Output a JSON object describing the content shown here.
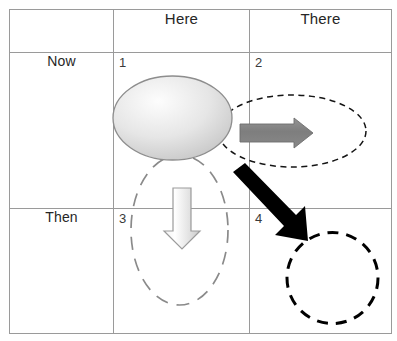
{
  "diagram": {
    "columns": [
      {
        "key": "rowlabel",
        "label": ""
      },
      {
        "key": "here",
        "label": "Here"
      },
      {
        "key": "there",
        "label": "There"
      }
    ],
    "rows": [
      {
        "key": "now",
        "label": "Now"
      },
      {
        "key": "then",
        "label": "Then"
      }
    ],
    "quadrants": [
      {
        "number": "1",
        "row": "Now",
        "column": "Here",
        "shape": "solid-gray-gradient-ellipse"
      },
      {
        "number": "2",
        "row": "Now",
        "column": "There",
        "shape": "fine-dashed-black-ellipse",
        "arrow": "gray-right-arrow"
      },
      {
        "number": "3",
        "row": "Then",
        "column": "Here",
        "shape": "long-dashed-gray-vertical-ellipse",
        "arrow": "light-gray-down-arrow"
      },
      {
        "number": "4",
        "row": "Then",
        "column": "There",
        "shape": "bold-dashed-black-circle",
        "arrow": "black-diagonal-arrow"
      }
    ],
    "colors": {
      "grid_line": "#9a9a9a",
      "text": "#262626",
      "solid_ellipse_fill_light": "#fbfbfb",
      "solid_ellipse_fill_dark": "#c8c8c8",
      "solid_ellipse_stroke": "#8d8d8d",
      "dashed_black": "#111111",
      "dashed_gray": "#8a8a8a",
      "gray_arrow_fill": "#838383",
      "gray_arrow_stroke": "#6e6e6e",
      "light_arrow_fill_light": "#ffffff",
      "light_arrow_fill_dark": "#d2d2d2",
      "light_arrow_stroke": "#9b9b9b",
      "black_arrow_fill": "#000000",
      "background": "#ffffff"
    }
  }
}
